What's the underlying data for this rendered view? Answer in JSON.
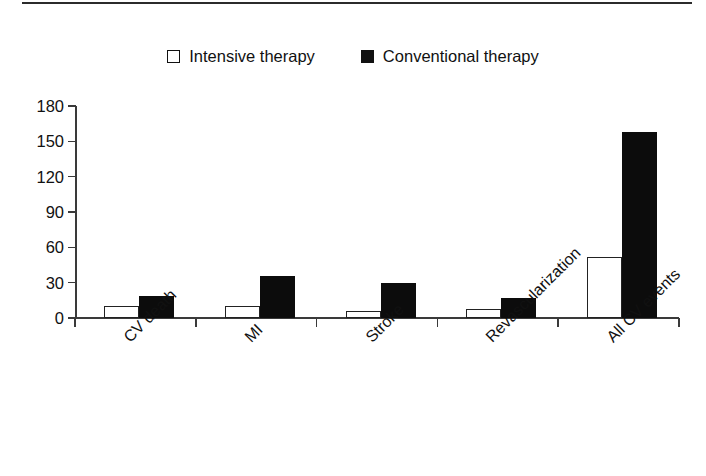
{
  "chart_data": {
    "type": "bar",
    "title": "",
    "subtitle": "",
    "xlabel": "",
    "ylabel": "",
    "categories": [
      "CV death",
      "MI",
      "Stroke",
      "Revascularization",
      "All CV events"
    ],
    "series": [
      {
        "name": "Intensive therapy",
        "marker": "open-square",
        "color": "#ffffff",
        "edge_color": "#222222",
        "values": [
          10,
          10,
          6,
          8,
          52
        ]
      },
      {
        "name": "Conventional therapy",
        "marker": "filled-square",
        "color": "#0c0c0c",
        "edge_color": "#0c0c0c",
        "values": [
          19,
          36,
          30,
          17,
          158
        ]
      }
    ],
    "ylim": [
      0,
      180
    ],
    "yticks": [
      0,
      30,
      60,
      90,
      120,
      150,
      180
    ],
    "ytick_labels": [
      "0",
      "30",
      "60",
      "90",
      "120",
      "150",
      "180"
    ],
    "grid": false,
    "legend_position": "top-center",
    "xtick_label_rotation": -45
  },
  "legend": {
    "items": [
      {
        "label": "Intensive therapy",
        "swatch": "open-square"
      },
      {
        "label": "Conventional therapy",
        "swatch": "filled-square"
      }
    ]
  },
  "axis": {
    "ytick_labels": [
      "180",
      "150",
      "120",
      "90",
      "60",
      "30",
      "0"
    ]
  },
  "xaxis": {
    "labels": [
      "CV death",
      "MI",
      "Stroke",
      "Revascularization",
      "All CV events"
    ]
  }
}
